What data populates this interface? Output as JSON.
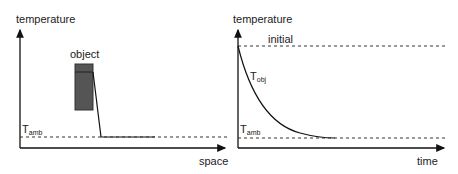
{
  "panels": [
    {
      "id": "space",
      "y_axis_label": "temperature",
      "x_axis_label": "space",
      "object_label": "object",
      "ambient_label": {
        "main": "T",
        "sub": "amb"
      }
    },
    {
      "id": "time",
      "y_axis_label": "temperature",
      "x_axis_label": "time",
      "initial_label": "initial",
      "object_temp_label": {
        "main": "T",
        "sub": "obj"
      },
      "ambient_label": {
        "main": "T",
        "sub": "amb"
      }
    }
  ],
  "colors": {
    "axis": "#111111",
    "object_fill": "#555555",
    "object_border": "#333333",
    "dashed": "#333333"
  }
}
